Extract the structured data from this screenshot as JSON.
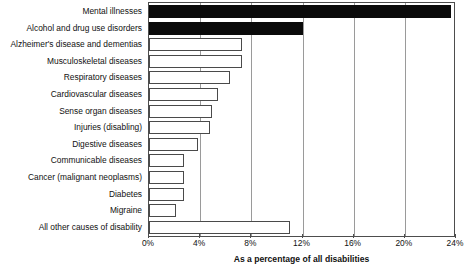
{
  "chart_data": {
    "type": "bar",
    "orientation": "horizontal",
    "title": "",
    "xlabel": "As a percentage of all disabilities",
    "ylabel": "",
    "xlim": [
      0,
      24
    ],
    "xticks": [
      "0%",
      "4%",
      "8%",
      "12%",
      "16%",
      "20%",
      "24%"
    ],
    "xtick_values": [
      0,
      4,
      8,
      12,
      16,
      20,
      24
    ],
    "grid": "vertical",
    "legend": "none",
    "categories": [
      "Mental illnesses",
      "Alcohol and drug use disorders",
      "Alzheimer's disease and dementias",
      "Musculoskeletal diseases",
      "Respiratory diseases",
      "Cardiovascular diseases",
      "Sense organ diseases",
      "Injuries (disabling)",
      "Digestive diseases",
      "Communicable diseases",
      "Cancer (malignant neoplasms)",
      "Diabetes",
      "Migraine",
      "All other causes of disability"
    ],
    "values": [
      23.6,
      12.0,
      7.3,
      7.3,
      6.3,
      5.4,
      4.9,
      4.8,
      3.8,
      2.7,
      2.7,
      2.7,
      2.1,
      11.0
    ],
    "bar_fill": [
      "black",
      "black",
      "white",
      "white",
      "white",
      "white",
      "white",
      "white",
      "white",
      "white",
      "white",
      "white",
      "white",
      "white"
    ],
    "colors": {
      "filled": "#0a0a0a",
      "outline": "#4a4a4a",
      "unfilled": "#ffffff",
      "grid": "#9a9a9a",
      "axis": "#4d4d4d"
    }
  }
}
